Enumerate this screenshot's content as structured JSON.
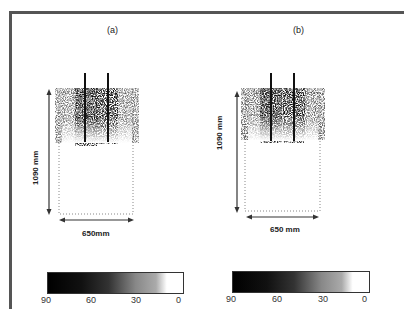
{
  "panels": [
    {
      "label": "(a)",
      "height_label": "1090 mm",
      "width_label": "650mm",
      "colorbar": {
        "ticks": [
          "90",
          "60",
          "30",
          "0"
        ],
        "colors": [
          "#000000",
          "#ffffff"
        ]
      }
    },
    {
      "label": "(b)",
      "height_label": "1090 mm",
      "width_label": "650 mm",
      "colorbar": {
        "ticks": [
          "90",
          "60",
          "30",
          "0"
        ],
        "colors": [
          "#000000",
          "#ffffff"
        ]
      }
    }
  ]
}
